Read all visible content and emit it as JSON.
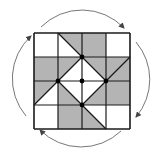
{
  "diagram": {
    "title": "",
    "colors": {
      "fill": "#b4b4b4",
      "line": "#1a1a1a",
      "arrow": "#555555",
      "background": "#ffffff"
    },
    "grid": {
      "rows": 4,
      "cols": 4,
      "x": 34,
      "y": 33,
      "size": 96
    },
    "gray_polygons": [
      [
        [
          1,
          0
        ],
        [
          2,
          0
        ],
        [
          2,
          1
        ]
      ],
      [
        [
          2,
          0
        ],
        [
          3,
          0
        ],
        [
          3,
          1
        ],
        [
          2,
          1
        ]
      ],
      [
        [
          0,
          1
        ],
        [
          1,
          1
        ],
        [
          1,
          2
        ],
        [
          0,
          2
        ]
      ],
      [
        [
          1,
          1
        ],
        [
          2,
          1
        ],
        [
          1,
          2
        ]
      ],
      [
        [
          2,
          1
        ],
        [
          3,
          1
        ],
        [
          3,
          2
        ]
      ],
      [
        [
          3,
          1
        ],
        [
          4,
          1
        ],
        [
          3,
          2
        ]
      ],
      [
        [
          0,
          2
        ],
        [
          1,
          2
        ],
        [
          0,
          3
        ]
      ],
      [
        [
          3,
          1
        ],
        [
          4,
          1
        ],
        [
          4,
          3
        ],
        [
          3,
          3
        ],
        [
          3,
          2
        ]
      ],
      [
        [
          1,
          2
        ],
        [
          2,
          3
        ],
        [
          1,
          3
        ]
      ],
      [
        [
          3,
          2
        ],
        [
          3,
          3
        ],
        [
          2,
          3
        ]
      ],
      [
        [
          1,
          3
        ],
        [
          2,
          3
        ],
        [
          2,
          4
        ],
        [
          1,
          4
        ]
      ],
      [
        [
          2,
          3
        ],
        [
          3,
          4
        ],
        [
          2,
          4
        ]
      ]
    ],
    "diagonals": [
      [
        [
          1,
          0
        ],
        [
          2,
          1
        ]
      ],
      [
        [
          2,
          1
        ],
        [
          3,
          2
        ]
      ],
      [
        [
          3,
          2
        ],
        [
          2,
          3
        ]
      ],
      [
        [
          2,
          3
        ],
        [
          1,
          2
        ]
      ],
      [
        [
          1,
          2
        ],
        [
          2,
          1
        ]
      ],
      [
        [
          3,
          2
        ],
        [
          4,
          1
        ]
      ],
      [
        [
          1,
          2
        ],
        [
          0,
          3
        ]
      ],
      [
        [
          2,
          3
        ],
        [
          3,
          4
        ]
      ]
    ],
    "dots": [
      [
        2,
        1
      ],
      [
        1,
        2
      ],
      [
        2,
        2
      ],
      [
        3,
        2
      ],
      [
        2,
        3
      ]
    ],
    "arrows": [
      {
        "name": "arrow-top",
        "direction": "clockwise"
      },
      {
        "name": "arrow-right",
        "direction": "clockwise"
      },
      {
        "name": "arrow-bottom",
        "direction": "clockwise"
      },
      {
        "name": "arrow-left",
        "direction": "clockwise"
      }
    ]
  }
}
